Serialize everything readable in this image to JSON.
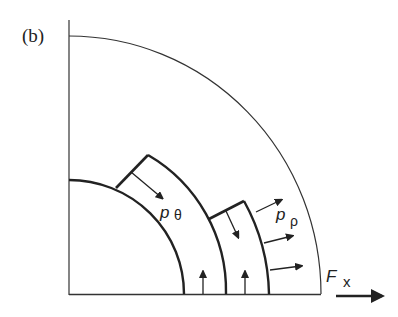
{
  "figure": {
    "panel_label": "(b)",
    "labels": {
      "p_theta": {
        "symbol": "p",
        "subscript": "θ"
      },
      "p_rho": {
        "symbol": "p",
        "subscript": "ρ"
      },
      "force": {
        "symbol": "F",
        "subscript": "x"
      }
    },
    "geometry": {
      "center": [
        69,
        294
      ],
      "outer_radius": 255,
      "inner_radius": 115,
      "middle_radius": 157,
      "outer_element_radius": 200
    },
    "colors": {
      "stroke": "#222222",
      "background": "#ffffff"
    }
  }
}
